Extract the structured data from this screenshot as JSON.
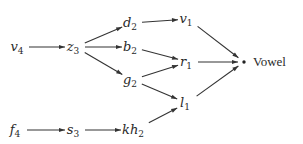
{
  "diagram": {
    "type": "directed-graph",
    "nodes": [
      {
        "id": "v4",
        "base": "v",
        "sub": "4"
      },
      {
        "id": "z3",
        "base": "z",
        "sub": "3"
      },
      {
        "id": "d2",
        "base": "d",
        "sub": "2"
      },
      {
        "id": "b2",
        "base": "b",
        "sub": "2"
      },
      {
        "id": "g2",
        "base": "g",
        "sub": "2"
      },
      {
        "id": "v1",
        "base": "v",
        "sub": "1"
      },
      {
        "id": "r1",
        "base": "r",
        "sub": "1"
      },
      {
        "id": "l1",
        "base": "l",
        "sub": "1"
      },
      {
        "id": "f4",
        "base": "f",
        "sub": "4"
      },
      {
        "id": "s3",
        "base": "s",
        "sub": "3"
      },
      {
        "id": "kh2",
        "base": "kh",
        "sub": "2"
      }
    ],
    "sink": {
      "id": "vowel",
      "label": "Vowel"
    },
    "edges": [
      [
        "v4",
        "z3"
      ],
      [
        "z3",
        "d2"
      ],
      [
        "z3",
        "b2"
      ],
      [
        "z3",
        "g2"
      ],
      [
        "d2",
        "v1"
      ],
      [
        "b2",
        "r1"
      ],
      [
        "g2",
        "r1"
      ],
      [
        "g2",
        "l1"
      ],
      [
        "f4",
        "s3"
      ],
      [
        "s3",
        "kh2"
      ],
      [
        "kh2",
        "l1"
      ],
      [
        "v1",
        "vowel"
      ],
      [
        "r1",
        "vowel"
      ],
      [
        "l1",
        "vowel"
      ]
    ]
  }
}
